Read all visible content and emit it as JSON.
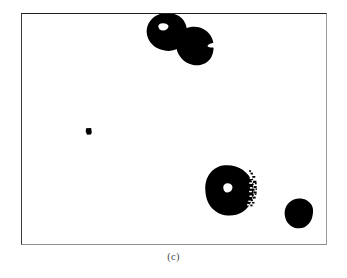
{
  "figure": {
    "caption": "(c)",
    "panel_label": "binary-segmentation-panel",
    "width": 347,
    "height": 278
  },
  "colors": {
    "page_background": "#ffffff",
    "panel_background": "#ffffff",
    "blob_fill": "#000000",
    "hole_fill": "#ffffff",
    "frame_top": "#231f20",
    "frame_left": "#3a3a3a",
    "frame_right": "#9a9a9a",
    "frame_bottom": "#8e8e8e",
    "caption_color": "#4a4a4a"
  },
  "panel": {
    "x": 21,
    "y": 13,
    "width": 306,
    "height": 232
  },
  "chart_data": {
    "type": "binary-mask",
    "title": "(c)",
    "xlabel": "",
    "ylabel": "",
    "units": "pixels",
    "coordinate_space": {
      "origin": "panel-top-left",
      "width": 306,
      "height": 232
    },
    "object_count": 5,
    "objects": [
      {
        "id": 1,
        "name": "top-left-ring-blob",
        "center_x": 145,
        "center_y": 18,
        "radius_x": 20,
        "radius_y": 18,
        "area_est": 1120,
        "has_hole": true,
        "hole": {
          "center_x": 142,
          "center_y": 13,
          "radius_x": 5,
          "radius_y": 3.2
        },
        "edge_texture": "smooth"
      },
      {
        "id": 2,
        "name": "top-right-notched-blob",
        "center_x": 173,
        "center_y": 31,
        "radius_x": 18,
        "radius_y": 18,
        "area_est": 1010,
        "has_hole": false,
        "hole": null,
        "edge_texture": "smooth-with-right-notch"
      },
      {
        "id": 3,
        "name": "small-isolated-dot",
        "center_x": 67,
        "center_y": 118,
        "radius_x": 3,
        "radius_y": 3.5,
        "area_est": 32,
        "has_hole": false,
        "hole": null,
        "edge_texture": "smooth"
      },
      {
        "id": 4,
        "name": "large-ring-blob",
        "center_x": 208,
        "center_y": 177,
        "radius_x": 24,
        "radius_y": 24,
        "area_est": 1810,
        "has_hole": true,
        "hole": {
          "center_x": 207,
          "center_y": 176,
          "radius_x": 4.5,
          "radius_y": 4
        },
        "edge_texture": "ragged-speckled-right-edge"
      },
      {
        "id": 5,
        "name": "bottom-right-blob",
        "center_x": 278,
        "center_y": 202,
        "radius_x": 14,
        "radius_y": 14,
        "area_est": 600,
        "has_hole": false,
        "hole": null,
        "edge_texture": "slightly-irregular"
      }
    ],
    "legend": [],
    "grid": false
  }
}
